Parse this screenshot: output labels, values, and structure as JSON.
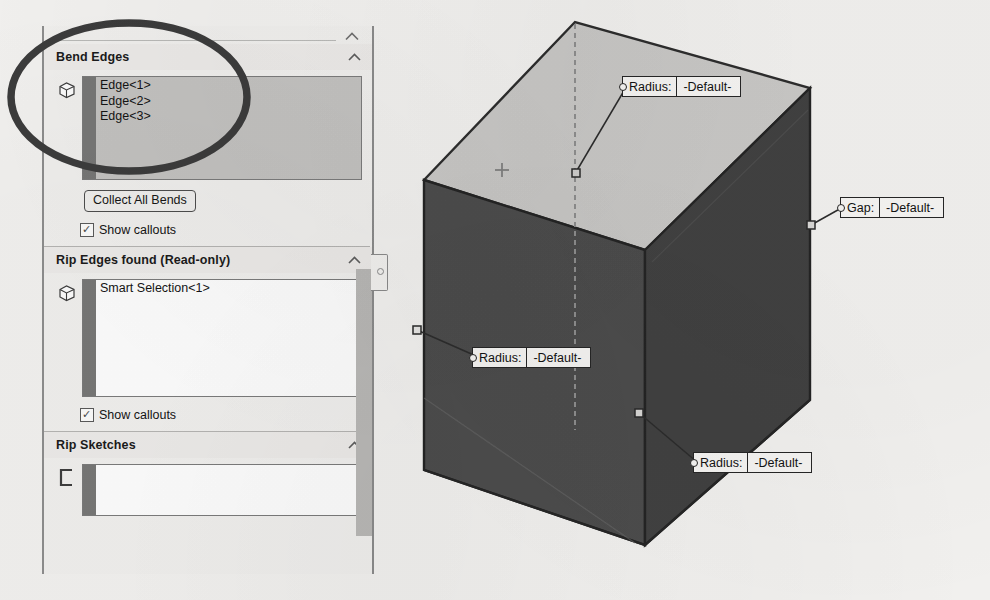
{
  "panel": {
    "collapse_icon": "chevron-up-icon",
    "sections": [
      {
        "id": "bend-edges",
        "title": "Bend Edges",
        "chevron": "chevron-up-icon",
        "list_icon": "box-edge-icon",
        "entries": [
          "Edge<1>",
          "Edge<2>",
          "Edge<3>"
        ],
        "button_label": "Collect All Bends",
        "checkbox_label": "Show callouts",
        "checkbox_checked": true,
        "check_glyph": "✓"
      },
      {
        "id": "rip-edges-found",
        "title": "Rip Edges found (Read-only)",
        "chevron": "chevron-up-icon",
        "list_icon": "box-edge-icon",
        "entries": [
          "Smart Selection<1>"
        ],
        "checkbox_label": "Show callouts",
        "checkbox_checked": true,
        "check_glyph": "✓"
      },
      {
        "id": "rip-sketches",
        "title": "Rip Sketches",
        "chevron": "chevron-up-icon",
        "list_icon": "sketch-profile-icon",
        "entries": []
      }
    ],
    "scrollbar": {
      "orientation": "vertical"
    },
    "splitter": {
      "handle_icon": "splitter-dot-icon"
    }
  },
  "annotation": {
    "shape": "ellipse-highlight",
    "color": "#3a3a3a"
  },
  "viewport": {
    "origin_marker": "origin-cross-icon",
    "callouts": [
      {
        "id": "callout-top-radius",
        "key": "Radius:",
        "value": "-Default-"
      },
      {
        "id": "callout-right-gap",
        "key": "Gap:",
        "value": "-Default-"
      },
      {
        "id": "callout-left-radius",
        "key": "Radius:",
        "value": "-Default-"
      },
      {
        "id": "callout-bottom-radius",
        "key": "Radius:",
        "value": "-Default-"
      }
    ],
    "model": {
      "name": "sheet-metal-box",
      "top_face_color": "#c9c8c6",
      "front_face_color": "#4a4a4a",
      "right_face_color": "#3f3f3f"
    }
  }
}
